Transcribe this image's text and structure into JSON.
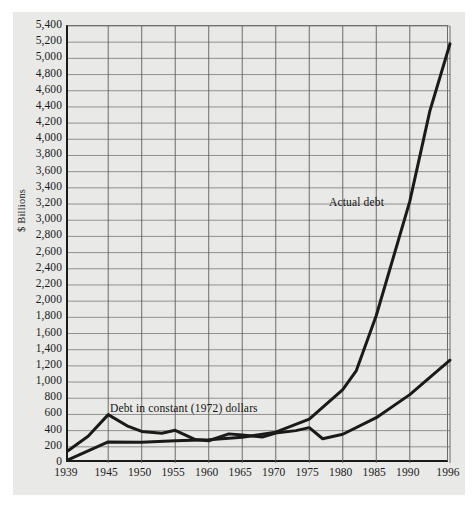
{
  "chart_data": {
    "type": "line",
    "title": "",
    "subtitle": "",
    "xlabel": "",
    "ylabel": "$ Billions",
    "xlim": [
      1939,
      1996
    ],
    "ylim": [
      0,
      5400
    ],
    "grid": true,
    "legend_position": "inline-annotations",
    "x_tick_labels": [
      "1939",
      "1945",
      "1950",
      "1955",
      "1960",
      "1965",
      "1970",
      "1975",
      "1980",
      "1985",
      "1990",
      "1996"
    ],
    "x_tick_values": [
      1939,
      1945,
      1950,
      1955,
      1960,
      1965,
      1970,
      1975,
      1980,
      1985,
      1990,
      1996
    ],
    "y_tick_labels": [
      "0",
      "200",
      "400",
      "600",
      "800",
      "1,000",
      "1,200",
      "1,400",
      "1,600",
      "1,800",
      "2,000",
      "2,200",
      "2,400",
      "2,600",
      "2,800",
      "3,000",
      "3,200",
      "3,400",
      "3,600",
      "3,800",
      "4,000",
      "4,200",
      "4,400",
      "4,600",
      "4,800",
      "5,000",
      "5,200",
      "5,400"
    ],
    "y_tick_values": [
      0,
      200,
      400,
      600,
      800,
      1000,
      1200,
      1400,
      1600,
      1800,
      2000,
      2200,
      2400,
      2600,
      2800,
      3000,
      3200,
      3400,
      3600,
      3800,
      4000,
      4200,
      4400,
      4600,
      4800,
      5000,
      5200,
      5400
    ],
    "series": [
      {
        "name": "Actual debt",
        "annotation": "Actual debt",
        "color": "#1a1a1a",
        "x": [
          1939,
          1945,
          1950,
          1955,
          1960,
          1965,
          1970,
          1975,
          1980,
          1982,
          1985,
          1990,
          1993,
          1996
        ],
        "values": [
          40,
          260,
          257,
          274,
          286,
          317,
          381,
          542,
          908,
          1137,
          1823,
          3233,
          4351,
          5181
        ]
      },
      {
        "name": "Debt in constant (1972) dollars",
        "annotation": "Debt in constant (1972) dollars",
        "color": "#1a1a1a",
        "x": [
          1939,
          1942,
          1945,
          1948,
          1950,
          1953,
          1955,
          1958,
          1960,
          1963,
          1965,
          1968,
          1970,
          1973,
          1975,
          1977,
          1980,
          1985,
          1990,
          1996
        ],
        "values": [
          152,
          330,
          598,
          452,
          390,
          368,
          404,
          290,
          275,
          360,
          345,
          320,
          370,
          400,
          437,
          300,
          355,
          560,
          845,
          1270
        ]
      }
    ]
  },
  "annotations": {
    "actual_debt": "Actual debt",
    "constant_dollars": "Debt in constant (1972) dollars"
  }
}
